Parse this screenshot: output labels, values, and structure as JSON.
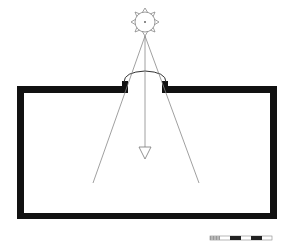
{
  "diagram": {
    "colors": {
      "wall": "#111111",
      "line": "#888888",
      "background": "#ffffff"
    },
    "sun": {
      "cx": 145,
      "cy": 22,
      "r": 10,
      "rays": 8
    },
    "room": {
      "outer": {
        "x": 17,
        "y": 86,
        "w": 260,
        "h": 133
      },
      "wall_thickness": 7
    },
    "opening": {
      "x1": 127,
      "x2": 163
    },
    "rays": [
      {
        "from": [
          145,
          36
        ],
        "to": [
          93,
          183
        ]
      },
      {
        "from": [
          145,
          36
        ],
        "to": [
          199,
          183
        ]
      }
    ],
    "center_arrow": {
      "from": [
        145,
        36
      ],
      "to": [
        145,
        158
      ]
    },
    "scale_bar": {
      "x": 210,
      "y": 236,
      "w": 62,
      "h": 4,
      "segments": [
        "hatched",
        "white",
        "black",
        "white",
        "black",
        "white"
      ]
    }
  }
}
